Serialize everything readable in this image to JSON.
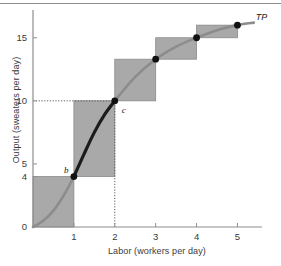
{
  "chart_data": {
    "type": "bar",
    "title": "",
    "subtitle": "",
    "xlabel": "Labor (workers per day)",
    "ylabel": "Output (sweaters per day)",
    "xlim": [
      0,
      5.6
    ],
    "ylim": [
      0,
      17.2
    ],
    "grid": false,
    "legend": null,
    "x_ticks": [
      {
        "value": 1,
        "label": "1"
      },
      {
        "value": 2,
        "label": "2"
      },
      {
        "value": 3,
        "label": "3"
      },
      {
        "value": 4,
        "label": "4"
      },
      {
        "value": 5,
        "label": "5"
      }
    ],
    "y_ticks": [
      {
        "value": 0,
        "label": "0"
      },
      {
        "value": 4,
        "label": "4"
      },
      {
        "value": 5,
        "label": "5"
      },
      {
        "value": 10,
        "label": "10"
      },
      {
        "value": 15,
        "label": "15"
      }
    ],
    "categories": [
      "0-1",
      "1-2",
      "2-3",
      "3-4",
      "4-5"
    ],
    "bars": [
      {
        "x_start": 0,
        "x_end": 1,
        "y_start": 0,
        "y_end": 4
      },
      {
        "x_start": 1,
        "x_end": 2,
        "y_start": 4,
        "y_end": 10
      },
      {
        "x_start": 2,
        "x_end": 3,
        "y_start": 10,
        "y_end": 13.3
      },
      {
        "x_start": 3,
        "x_end": 4,
        "y_start": 13.3,
        "y_end": 15
      },
      {
        "x_start": 4,
        "x_end": 5,
        "y_start": 15,
        "y_end": 16
      }
    ],
    "series": [
      {
        "name": "TP",
        "label": "TP",
        "type": "line",
        "x": [
          0,
          0.25,
          0.5,
          0.75,
          1,
          1.25,
          1.5,
          1.75,
          2,
          2.5,
          3,
          3.5,
          4,
          4.5,
          5,
          5.4
        ],
        "y": [
          0,
          0.5,
          1.3,
          2.5,
          4,
          5.8,
          7.5,
          8.9,
          10,
          11.9,
          13.3,
          14.3,
          15,
          15.6,
          16,
          16.2
        ]
      }
    ],
    "points": [
      {
        "label": "b",
        "x": 1,
        "y": 4,
        "label_dx": -10,
        "label_dy": -12
      },
      {
        "label": "c",
        "x": 2,
        "y": 10,
        "label_dx": 7,
        "label_dy": 4
      },
      {
        "label": "",
        "x": 3,
        "y": 13.3,
        "label_dx": 0,
        "label_dy": 0
      },
      {
        "label": "",
        "x": 4,
        "y": 15,
        "label_dx": 0,
        "label_dy": 0
      },
      {
        "label": "",
        "x": 5,
        "y": 16,
        "label_dx": 0,
        "label_dy": 0
      }
    ],
    "annotations": [
      {
        "name": "tp-curve-label",
        "text": "TP",
        "x": 5.45,
        "y": 16.6
      }
    ],
    "guide_lines": [
      {
        "name": "output-10-guideline",
        "orientation": "horizontal",
        "value": 10,
        "from": 0,
        "to": 2,
        "style": "dotted"
      },
      {
        "name": "labor-2-guideline",
        "orientation": "vertical",
        "value": 2,
        "from": 0,
        "to": 10,
        "style": "dotted"
      }
    ],
    "colors": {
      "bar_fill": "#a9a9a9",
      "bar_edge": "#8a8a8a",
      "curve": "#1c1c1c",
      "curve_light": "#8c8c8c",
      "axis": "#8e8e8e",
      "text": "#3a3a3a",
      "point": "#111111",
      "background": "#ffffff"
    }
  }
}
